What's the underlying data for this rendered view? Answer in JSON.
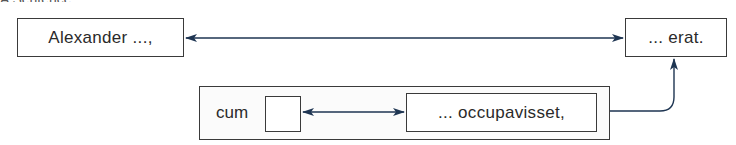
{
  "diagram": {
    "top_cutoff_text": "A Sentence",
    "main_clause": {
      "subject_box": "Alexander ...,",
      "verb_box": "... erat."
    },
    "subordinate_clause": {
      "conjunction": "cum",
      "empty_slot": "",
      "verb_box": "... occupavisset,"
    },
    "colors": {
      "arrow": "#1e3552",
      "box_border": "#3a3a3a",
      "text": "#2a2a2a"
    },
    "connections": [
      {
        "from": "subject_box",
        "to": "verb_box",
        "type": "double-arrow"
      },
      {
        "from": "empty_slot",
        "to": "subordinate_verb_box",
        "type": "double-arrow"
      },
      {
        "from": "subordinate_clause",
        "to": "verb_box",
        "type": "arrow"
      }
    ]
  }
}
